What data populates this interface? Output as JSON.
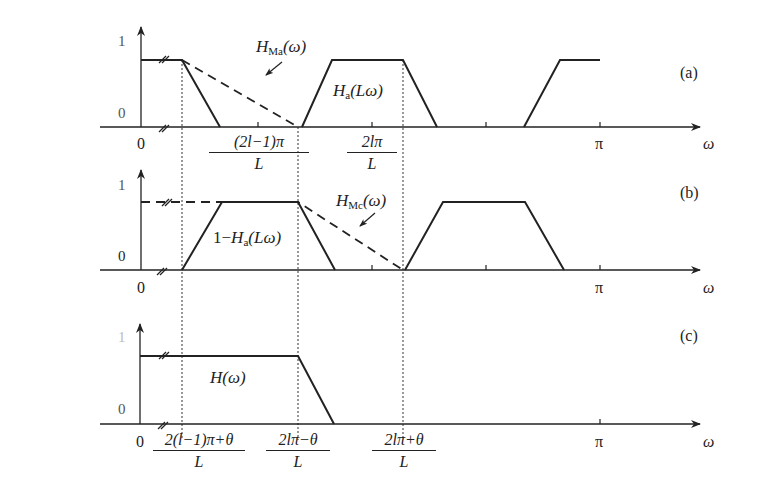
{
  "figure": {
    "panels": [
      {
        "id": "a",
        "tag": "(a)",
        "y_labels": {
          "top": "1",
          "bottom": "0"
        },
        "x_labels": {
          "origin": "0",
          "tick1_num": "(2l−1)π",
          "tick1_den": "L",
          "tick2_num": "2lπ",
          "tick2_den": "L",
          "pi": "π",
          "axis": "ω"
        },
        "curve_labels": {
          "dashed": {
            "main": "H",
            "sub": "Ma",
            "arg": "(ω)"
          },
          "solid": {
            "main": "H",
            "sub": "a",
            "arg": "(Lω)"
          }
        }
      },
      {
        "id": "b",
        "tag": "(b)",
        "y_labels": {
          "top": "1",
          "bottom": "0"
        },
        "x_labels": {
          "origin": "0",
          "pi": "π",
          "axis": "ω"
        },
        "curve_labels": {
          "dashed": {
            "main": "H",
            "sub": "Mc",
            "arg": "(ω)"
          },
          "solid": {
            "prefix": "1−",
            "main": "H",
            "sub": "a",
            "arg": "(Lω)"
          }
        }
      },
      {
        "id": "c",
        "tag": "(c)",
        "y_labels": {
          "top": "1",
          "bottom": "0"
        },
        "x_labels": {
          "origin": "0",
          "tick1_num": "2(l−1)π+θ",
          "tick1_den": "L",
          "tick2_num": "2lπ−θ",
          "tick2_den": "L",
          "tick3_num": "2lπ+θ",
          "tick3_den": "L",
          "pi": "π",
          "axis": "ω"
        },
        "curve_labels": {
          "solid": {
            "main": "H",
            "arg": "(ω)"
          }
        }
      }
    ]
  }
}
